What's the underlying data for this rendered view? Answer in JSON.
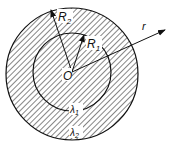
{
  "diagram": {
    "labels": {
      "r_outer": "R",
      "r_outer_sub": "2",
      "r_inner": "R",
      "r_inner_sub": "1",
      "origin": "O",
      "radial_axis": "r",
      "lambda_inner": "λ",
      "lambda_inner_sub": "1",
      "lambda_outer": "λ",
      "lambda_outer_sub": "2"
    },
    "colors": {
      "stroke": "#111111",
      "background": "#ffffff"
    }
  }
}
